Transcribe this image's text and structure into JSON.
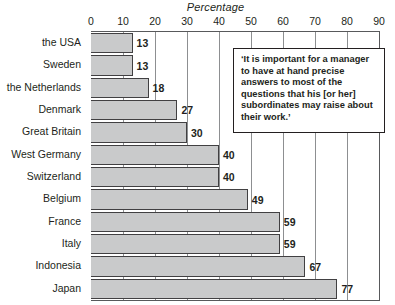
{
  "chart_data": {
    "type": "bar",
    "orientation": "horizontal",
    "title": "",
    "xlabel": "Percentage",
    "ylabel": "",
    "xlim": [
      0,
      90
    ],
    "xticks": [
      0,
      10,
      20,
      30,
      40,
      50,
      60,
      70,
      80,
      90
    ],
    "grid": true,
    "grid_axis": "x",
    "legend": false,
    "categories": [
      "the USA",
      "Sweden",
      "the Netherlands",
      "Denmark",
      "Great Britain",
      "West Germany",
      "Switzerland",
      "Belgium",
      "France",
      "Italy",
      "Indonesia",
      "Japan"
    ],
    "values": [
      13,
      13,
      18,
      27,
      30,
      40,
      40,
      49,
      59,
      59,
      67,
      77
    ],
    "data_labels": [
      "13",
      "13",
      "18",
      "27",
      "30",
      "40",
      "40",
      "49",
      "59",
      "59",
      "67",
      "77"
    ],
    "annotation": "‘It is important for a manager to have at hand precise answers to most of the questions that his [or her] subordinates may raise about their work.’",
    "colors": {
      "bar_fill": "#c9cacb",
      "bar_border": "#414042",
      "gridline": "#8d8f91",
      "axis": "#58595b",
      "text": "#231f20",
      "background": "#ffffff"
    }
  }
}
